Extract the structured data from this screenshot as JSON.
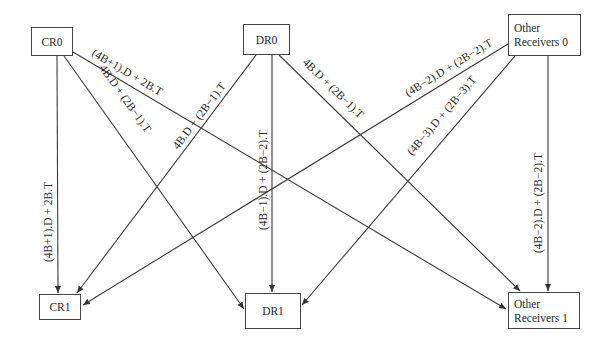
{
  "nodes": {
    "cr0": {
      "label": "CR0"
    },
    "dr0": {
      "label": "DR0"
    },
    "or0": {
      "line1": "Other",
      "line2": "Receivers 0"
    },
    "cr1": {
      "label": "CR1"
    },
    "dr1": {
      "label": "DR1"
    },
    "or1": {
      "line1": "Other",
      "line2": "Receivers 1"
    }
  },
  "edges": [
    {
      "from": "CR0",
      "to": "CR1",
      "label": "(4B+1).D + 2B.T"
    },
    {
      "from": "CR0",
      "to": "DR1",
      "label": "4B.D + (2B−1).T"
    },
    {
      "from": "CR0",
      "to": "Other Receivers 1",
      "label": "(4B+1).D + 2B.T"
    },
    {
      "from": "DR0",
      "to": "CR1",
      "label": "4B.D + (2B−1).T"
    },
    {
      "from": "DR0",
      "to": "DR1",
      "label": "(4B−1).D + (2B−2).T"
    },
    {
      "from": "DR0",
      "to": "Other Receivers 1",
      "label": "4B.D + (2B−1).T"
    },
    {
      "from": "Other Receivers 0",
      "to": "CR1",
      "label": "(4B−2).D + (2B−2).T"
    },
    {
      "from": "Other Receivers 0",
      "to": "DR1",
      "label": "(4B−3).D + (2B−3).T"
    },
    {
      "from": "Other Receivers 0",
      "to": "Other Receivers 1",
      "label": "(4B−2).D + (2B−2).T"
    }
  ]
}
